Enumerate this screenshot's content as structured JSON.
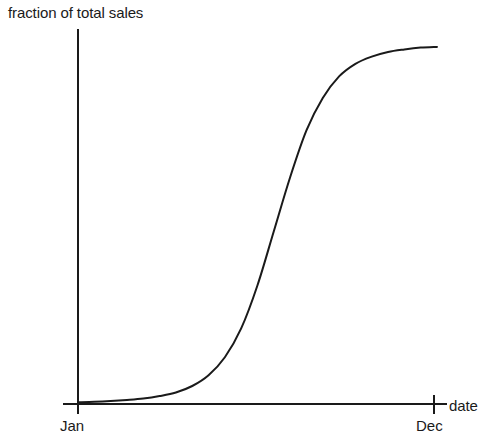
{
  "chart_data": {
    "type": "line",
    "title": "",
    "subtitle": "",
    "ylabel": "fraction of total sales",
    "xlabel": "date",
    "x_tick_labels": [
      "Jan",
      "Dec"
    ],
    "y_tick_labels": [],
    "grid": false,
    "legend": null,
    "annotations": [],
    "axis_style": "open-corner-axes-with-end-ticks",
    "line_color": "#1a1a1a",
    "line_width": 2,
    "xlim": [
      0,
      11
    ],
    "ylim": [
      0,
      1
    ],
    "x": [
      0,
      0.5,
      1,
      1.5,
      2,
      2.5,
      3,
      3.5,
      4,
      4.5,
      5,
      5.5,
      6,
      6.5,
      7,
      7.5,
      8,
      8.5,
      9,
      9.5,
      10,
      10.5,
      11
    ],
    "series": [
      {
        "name": "cumulative sales",
        "values": [
          0.005,
          0.006,
          0.008,
          0.011,
          0.015,
          0.022,
          0.032,
          0.05,
          0.08,
          0.13,
          0.21,
          0.33,
          0.48,
          0.63,
          0.76,
          0.85,
          0.91,
          0.945,
          0.965,
          0.978,
          0.985,
          0.99,
          0.992
        ]
      }
    ]
  },
  "figure": {
    "background_color": "#ffffff",
    "ylabel_text": "fraction of total sales",
    "xlabel_text": "date",
    "x_start_tick_label": "Jan",
    "x_end_tick_label": "Dec"
  }
}
